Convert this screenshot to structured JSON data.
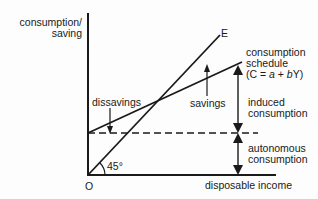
{
  "diagram": {
    "type": "economics-consumption-function",
    "y_axis_label_line1": "consumption/",
    "y_axis_label_line2": "saving",
    "x_axis_label": "disposable income",
    "origin_label": "O",
    "angle_label": "45°",
    "line_45_label": "E",
    "consumption_label_line1": "consumption",
    "consumption_label_line2": "schedule",
    "consumption_label_line3_prefix": "(C = ",
    "consumption_label_a": "a",
    "consumption_label_plus": " + ",
    "consumption_label_b": "b",
    "consumption_label_suffix": "Y)",
    "dissavings_label": "dissavings",
    "savings_label": "savings",
    "induced_label_line1": "induced",
    "induced_label_line2": "consumption",
    "autonomous_label_line1": "autonomous",
    "autonomous_label_line2": "consumption",
    "colors": {
      "ink": "#1a1a1a",
      "background": "#fdfdfd"
    }
  }
}
